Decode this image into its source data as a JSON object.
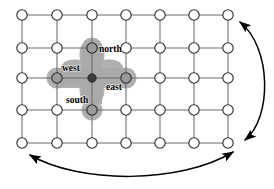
{
  "figure": {
    "name": "torus-grid-neighborhood-diagram",
    "title": "",
    "caption": ""
  },
  "colors": {
    "background": "#ffffff",
    "grid_line": "#6b6b6b",
    "node_stroke": "#2b2b2b",
    "node_fill": "#ffffff",
    "center_node_fill": "#3b3b3b",
    "neighbor_node_fill": "#9a9a9a",
    "blob_fill": "#a9a9a9",
    "label_text": "#000000",
    "arrow_stroke": "#000000"
  },
  "grid": {
    "columns": 7,
    "rows": 5,
    "column_x": [
      22,
      57,
      92,
      126,
      160,
      194,
      228
    ],
    "row_y": [
      15,
      48,
      78,
      110,
      143
    ],
    "node_radius": 5.2,
    "center_node_radius": 4.2
  },
  "neighborhood": {
    "center": {
      "col": 2,
      "row": 2
    },
    "labels": [
      {
        "id": "north",
        "text": "north",
        "x": 99,
        "y": 52,
        "anchor": "start"
      },
      {
        "id": "west",
        "text": "west",
        "x": 62,
        "y": 71,
        "anchor": "start"
      },
      {
        "id": "east",
        "text": "east",
        "x": 106,
        "y": 90,
        "anchor": "start"
      },
      {
        "id": "south",
        "text": "south",
        "x": 66,
        "y": 103,
        "anchor": "start"
      }
    ],
    "members": [
      {
        "id": "center",
        "col": 2,
        "row": 2
      },
      {
        "id": "north",
        "col": 2,
        "row": 1
      },
      {
        "id": "west",
        "col": 1,
        "row": 2
      },
      {
        "id": "east",
        "col": 3,
        "row": 2
      },
      {
        "id": "south",
        "col": 2,
        "row": 3
      }
    ]
  },
  "wrap_arrows": [
    {
      "id": "vertical-wrap-arrow",
      "description": "right-side curved arrow connecting bottom-right to top-right",
      "path": "M 245 140 C 272 118 272 48 240 22",
      "arrowheads": [
        "start",
        "end"
      ]
    },
    {
      "id": "horizontal-wrap-arrow",
      "description": "bottom curved arrow connecting bottom-right to bottom-left",
      "path": "M 233 152 C 180 184 80 184 30 155",
      "arrowheads": [
        "start",
        "end"
      ]
    }
  ]
}
